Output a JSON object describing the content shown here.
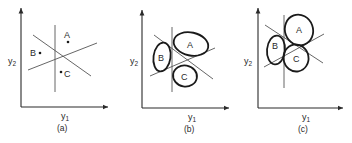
{
  "figure": {
    "panels": [
      {
        "id": "a",
        "caption": "(a)",
        "xlabel": "y",
        "xlabel_sub": "1",
        "ylabel": "y",
        "ylabel_sub": "2",
        "classes": [
          {
            "label": "A",
            "representation": "point"
          },
          {
            "label": "B",
            "representation": "point"
          },
          {
            "label": "C",
            "representation": "point"
          }
        ]
      },
      {
        "id": "b",
        "caption": "(b)",
        "xlabel": "y",
        "xlabel_sub": "1",
        "ylabel": "y",
        "ylabel_sub": "2",
        "classes": [
          {
            "label": "A",
            "representation": "ellipse"
          },
          {
            "label": "B",
            "representation": "ellipse"
          },
          {
            "label": "C",
            "representation": "ellipse"
          }
        ]
      },
      {
        "id": "c",
        "caption": "(c)",
        "xlabel": "y",
        "xlabel_sub": "1",
        "ylabel": "y",
        "ylabel_sub": "2",
        "classes": [
          {
            "label": "A",
            "representation": "ellipse"
          },
          {
            "label": "B",
            "representation": "ellipse"
          },
          {
            "label": "C",
            "representation": "ellipse"
          }
        ]
      }
    ],
    "colors": {
      "ink": "#2a2a2a",
      "boundary": "#555555",
      "background": "#ffffff"
    }
  }
}
